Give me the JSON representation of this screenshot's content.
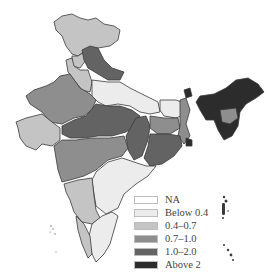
{
  "map": {
    "title": "",
    "region": "India",
    "type": "choropleth"
  },
  "legend": {
    "items": [
      {
        "label": "NA",
        "color": "#ffffff"
      },
      {
        "label": "Below 0.4",
        "color": "#ececec"
      },
      {
        "label": "0.4–0.7",
        "color": "#c4c4c4"
      },
      {
        "label": "0.7–1.0",
        "color": "#8e8e8e"
      },
      {
        "label": "1.0–2.0",
        "color": "#636363"
      },
      {
        "label": "Above 2",
        "color": "#2c2c2c"
      }
    ]
  },
  "regions": [
    {
      "name": "Jammu & Kashmir",
      "class": "0.4–0.7"
    },
    {
      "name": "Himachal Pradesh",
      "class": "0.4–0.7"
    },
    {
      "name": "Uttarakhand",
      "class": "1.0–2.0"
    },
    {
      "name": "Punjab",
      "class": "0.4–0.7"
    },
    {
      "name": "Haryana",
      "class": "0.4–0.7"
    },
    {
      "name": "Rajasthan",
      "class": "0.7–1.0"
    },
    {
      "name": "Uttar Pradesh",
      "class": "Below 0.4"
    },
    {
      "name": "Bihar",
      "class": "Below 0.4"
    },
    {
      "name": "Gujarat",
      "class": "0.4–0.7"
    },
    {
      "name": "Madhya Pradesh",
      "class": "1.0–2.0"
    },
    {
      "name": "Chhattisgarh",
      "class": "1.0–2.0"
    },
    {
      "name": "Jharkhand",
      "class": "0.7–1.0"
    },
    {
      "name": "West Bengal",
      "class": "0.7–1.0"
    },
    {
      "name": "Odisha",
      "class": "1.0–2.0"
    },
    {
      "name": "Maharashtra",
      "class": "0.7–1.0"
    },
    {
      "name": "Andhra Pradesh",
      "class": "Below 0.4"
    },
    {
      "name": "Karnataka",
      "class": "0.4–0.7"
    },
    {
      "name": "Goa",
      "class": "0.4–0.7"
    },
    {
      "name": "Kerala",
      "class": "0.4–0.7"
    },
    {
      "name": "Tamil Nadu",
      "class": "Below 0.4"
    },
    {
      "name": "Sikkim",
      "class": "Above 2"
    },
    {
      "name": "Northeast states",
      "class": "Above 2"
    },
    {
      "name": "Meghalaya/Assam",
      "class": "0.7–1.0"
    }
  ]
}
